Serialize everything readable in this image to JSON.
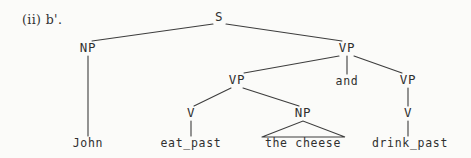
{
  "figure": {
    "example_label": "(ii) b'.",
    "ink_color": "#303030",
    "background_color": "#fbfbf9"
  },
  "tree": {
    "nodes": [
      {
        "id": "S",
        "label": "S",
        "x": 219,
        "y": 17
      },
      {
        "id": "NP1",
        "label": "NP",
        "x": 88,
        "y": 48
      },
      {
        "id": "VP_top",
        "label": "VP",
        "x": 347,
        "y": 48
      },
      {
        "id": "VP_l",
        "label": "VP",
        "x": 237,
        "y": 80
      },
      {
        "id": "VP_r",
        "label": "VP",
        "x": 408,
        "y": 80
      },
      {
        "id": "V_l",
        "label": "V",
        "x": 191,
        "y": 113
      },
      {
        "id": "NP2",
        "label": "NP",
        "x": 303,
        "y": 113
      },
      {
        "id": "V_r",
        "label": "V",
        "x": 408,
        "y": 113
      }
    ],
    "conjunction": {
      "label": "and",
      "x": 347,
      "y": 82
    },
    "terminals": [
      {
        "id": "t_john",
        "label": "John",
        "x": 88,
        "y": 144
      },
      {
        "id": "t_eat",
        "label": "eat_past",
        "x": 191,
        "y": 144
      },
      {
        "id": "t_the",
        "label": "the cheese",
        "x": 303,
        "y": 144
      },
      {
        "id": "t_drink",
        "label": "drink_past",
        "x": 410,
        "y": 144
      }
    ],
    "edges": [
      {
        "from": "S",
        "to": "NP1",
        "x1": 213,
        "y1": 24,
        "x2": 92,
        "y2": 41
      },
      {
        "from": "S",
        "to": "VP_top",
        "x1": 226,
        "y1": 24,
        "x2": 342,
        "y2": 41
      },
      {
        "from": "VP_top",
        "to": "VP_l",
        "x1": 339,
        "y1": 56,
        "x2": 244,
        "y2": 73
      },
      {
        "from": "VP_top",
        "to": "and",
        "x1": 347,
        "y1": 56,
        "x2": 347,
        "y2": 74
      },
      {
        "from": "VP_top",
        "to": "VP_r",
        "x1": 354,
        "y1": 56,
        "x2": 402,
        "y2": 73
      },
      {
        "from": "VP_l",
        "to": "V_l",
        "x1": 231,
        "y1": 88,
        "x2": 194,
        "y2": 106
      },
      {
        "from": "VP_l",
        "to": "NP2",
        "x1": 243,
        "y1": 88,
        "x2": 299,
        "y2": 106
      },
      {
        "from": "VP_r",
        "to": "V_r",
        "x1": 408,
        "y1": 88,
        "x2": 408,
        "y2": 106
      },
      {
        "from": "NP1",
        "to": "t_john",
        "x1": 88,
        "y1": 56,
        "x2": 88,
        "y2": 136
      },
      {
        "from": "V_l",
        "to": "t_eat",
        "x1": 191,
        "y1": 121,
        "x2": 191,
        "y2": 136
      },
      {
        "from": "V_r",
        "to": "t_drink",
        "x1": 408,
        "y1": 121,
        "x2": 408,
        "y2": 136
      }
    ],
    "triangle": {
      "parent": "NP2",
      "apex_x": 303,
      "apex_y": 121,
      "left_x": 262,
      "right_x": 345,
      "base_y": 137
    }
  }
}
